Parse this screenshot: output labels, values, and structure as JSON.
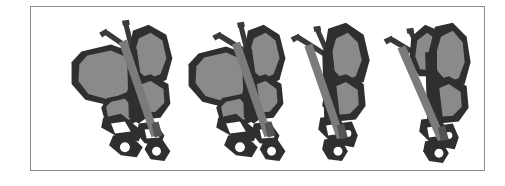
{
  "figure": {
    "kind": "image-figure",
    "subject": "butterfly",
    "description": "Four grayscale clip-art views of a butterfly perched on a twig, shown in sequence with progressively closing wings",
    "panel_count": 4,
    "background_color": "#ffffff",
    "border_color": "#8c8c8c",
    "border_width_px": 1,
    "frame": {
      "left": 30,
      "top": 6,
      "width": 455,
      "height": 165
    },
    "palette": {
      "outline_dark": "#2f2f2f",
      "wing_fill_gray": "#8a8a8a",
      "twig_gray": "#7b7b7b",
      "highlight_white": "#ffffff",
      "shadow_mid": "#545454"
    },
    "panels": [
      {
        "index": 1,
        "label": "butterfly-view-1",
        "pose": "wings fully open, both forewings and hindwings visible",
        "left_px": 20,
        "width_px": 130,
        "wing_state": "open",
        "left_wing_visible": true,
        "right_wing_visible": true,
        "antennae": 2,
        "twig_visible": true
      },
      {
        "index": 2,
        "label": "butterfly-view-2",
        "pose": "wings partly closed, left wing foreshortened",
        "left_px": 145,
        "width_px": 120,
        "wing_state": "partly-closed",
        "left_wing_visible": true,
        "right_wing_visible": true,
        "antennae": 2,
        "twig_visible": true
      },
      {
        "index": 3,
        "label": "butterfly-view-3",
        "pose": "wings nearly closed, narrow profile view",
        "left_px": 255,
        "width_px": 105,
        "wing_state": "nearly-closed",
        "left_wing_visible": false,
        "right_wing_visible": true,
        "antennae": 2,
        "twig_visible": true
      },
      {
        "index": 4,
        "label": "butterfly-view-4",
        "pose": "wings closed, side profile on twig",
        "left_px": 350,
        "width_px": 110,
        "wing_state": "closed",
        "left_wing_visible": false,
        "right_wing_visible": true,
        "antennae": 2,
        "twig_visible": true
      }
    ]
  }
}
